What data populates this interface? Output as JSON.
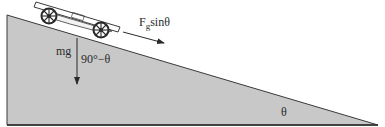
{
  "diagram": {
    "colors": {
      "incline_fill": "#c8c8c8",
      "incline_edge": "#3a3a3a",
      "ink": "#2a2a2a"
    },
    "labels": {
      "force_parallel_main": "F",
      "force_parallel_sub": "g",
      "force_parallel_rest": "sinθ",
      "weight": "mg",
      "angle_complement": "90°−θ",
      "incline_angle": "θ"
    },
    "elements": {
      "incline": "right-triangle-ramp",
      "object": "cart-with-two-wheels",
      "arrow_parallel": "down-slope-arrow",
      "arrow_weight": "downward-arrow"
    }
  }
}
